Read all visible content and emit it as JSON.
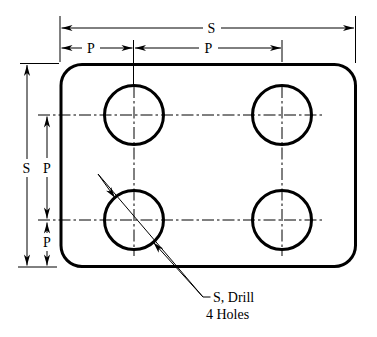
{
  "figure": {
    "background": "#ffffff",
    "line_color": "#000000"
  },
  "dimensions": {
    "top_overall": "S",
    "top_pitch_left": "P",
    "top_pitch_right": "P",
    "left_overall": "S",
    "left_pitch_upper": "P",
    "left_pitch_lower": "P"
  },
  "callout": {
    "line1": "S, Drill",
    "line2": "4 Holes"
  }
}
